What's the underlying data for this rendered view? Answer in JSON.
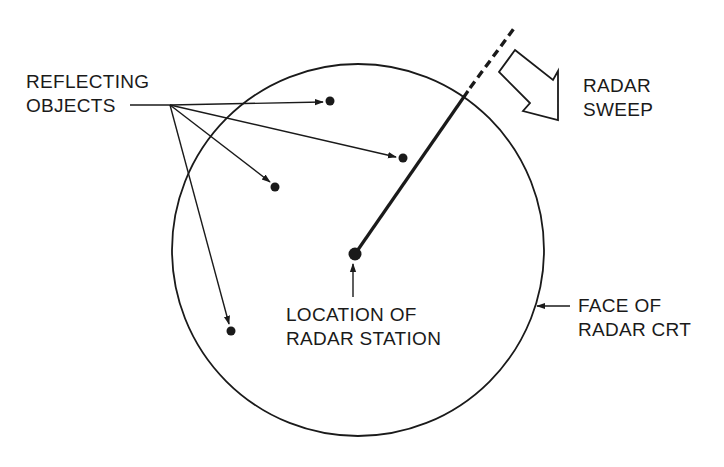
{
  "diagram": {
    "colors": {
      "ink": "#1a1a1a",
      "background": "#ffffff"
    },
    "labels": {
      "reflecting_objects": [
        "REFLECTING",
        "OBJECTS"
      ],
      "radar_sweep": [
        "RADAR",
        "SWEEP"
      ],
      "location_of_radar_station": [
        "LOCATION OF",
        "RADAR STATION"
      ],
      "face_of_radar_crt": [
        "FACE OF",
        "RADAR CRT"
      ]
    },
    "crt_circle": {
      "cx": 358,
      "cy": 250,
      "r": 186
    },
    "radar_station": {
      "x": 355,
      "y": 254
    },
    "sweep_line": {
      "from": [
        355,
        254
      ],
      "to": [
        467,
        90
      ],
      "dashed_to": [
        515,
        27
      ]
    },
    "reflecting_objects": [
      {
        "x": 330,
        "y": 101
      },
      {
        "x": 403,
        "y": 158
      },
      {
        "x": 275,
        "y": 187
      },
      {
        "x": 231,
        "y": 331
      }
    ]
  }
}
